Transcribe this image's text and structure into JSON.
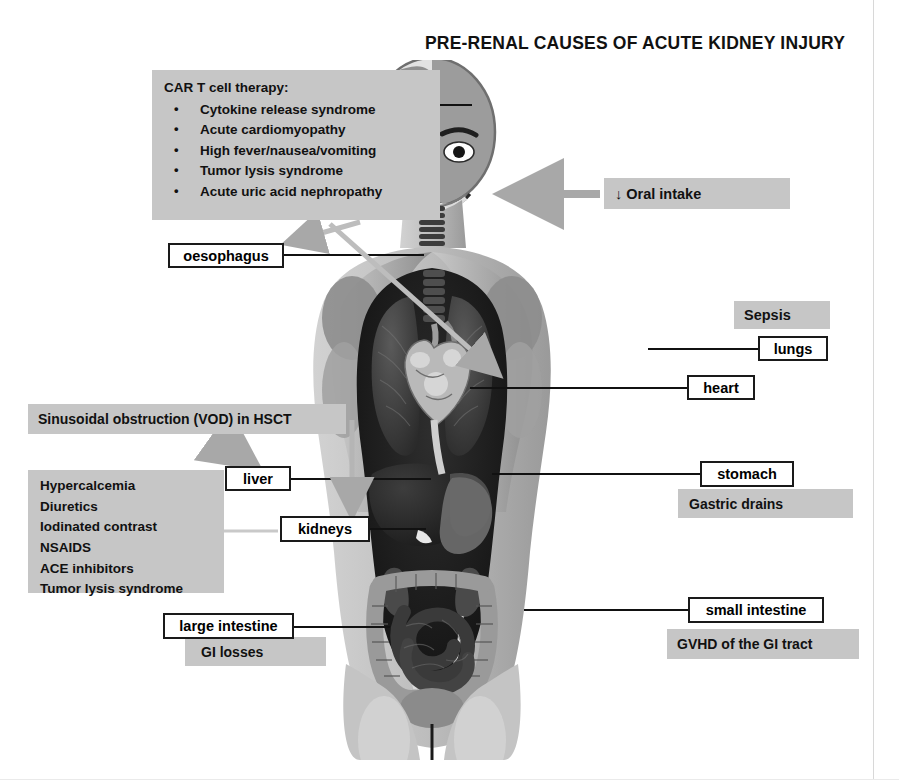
{
  "title": "PRE-RENAL CAUSES OF ACUTE KIDNEY INJURY",
  "colors": {
    "gray_box": "#c6c6c6",
    "box_border": "#1a1a1a",
    "text": "#111111",
    "background": "#ffffff",
    "connector": "#111111",
    "arrow_gray": "#a8a8a8"
  },
  "car_t_box": {
    "heading": "CAR T cell therapy:",
    "items": [
      "Cytokine release syndrome",
      "Acute cardiomyopathy",
      "High fever/nausea/vomiting",
      "Tumor lysis syndrome",
      "Acute uric acid nephropathy"
    ]
  },
  "vod_box": {
    "label": "Sinusoidal obstruction (VOD) in HSCT"
  },
  "drug_box": {
    "items": [
      "Hypercalcemia",
      "Diuretics",
      "Iodinated contrast",
      "NSAIDS",
      "ACE inhibitors",
      "Tumor lysis syndrome"
    ]
  },
  "oral_intake": {
    "label": "↓ Oral intake"
  },
  "cause_boxes": {
    "sepsis": "Sepsis",
    "gastric_drains": "Gastric drains",
    "gvhd": "GVHD of the GI tract",
    "gi_losses": "GI losses"
  },
  "organ_labels": {
    "oesophagus": "oesophagus",
    "lungs": "lungs",
    "heart": "heart",
    "liver": "liver",
    "kidneys": "kidneys",
    "stomach": "stomach",
    "small_intestine": "small intestine",
    "large_intestine": "large intestine"
  },
  "figure": {
    "alt": "Human body anatomy illustration: head split between skull/brain and face, trachea, lungs, heart, liver, stomach, intestines, kidneys"
  }
}
